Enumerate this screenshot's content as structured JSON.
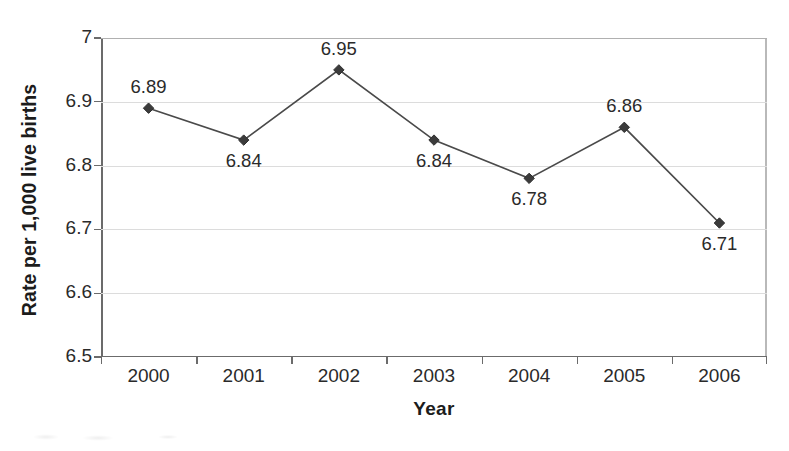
{
  "chart_data": {
    "type": "line",
    "title": "",
    "xlabel": "Year",
    "ylabel": "Rate per 1,000 live births",
    "categories": [
      "2000",
      "2001",
      "2002",
      "2003",
      "2004",
      "2005",
      "2006"
    ],
    "values": [
      6.89,
      6.84,
      6.95,
      6.84,
      6.78,
      6.86,
      6.71
    ],
    "point_labels": [
      "6.89",
      "6.84",
      "6.95",
      "6.84",
      "6.78",
      "6.86",
      "6.71"
    ],
    "label_positions": [
      "above",
      "below",
      "above",
      "below",
      "below",
      "above",
      "below"
    ],
    "ylim": [
      6.5,
      7.0
    ],
    "ytick_labels": [
      "7",
      "6.9",
      "6.8",
      "6.7",
      "6.6",
      "6.5"
    ],
    "ytick_values": [
      7.0,
      6.9,
      6.8,
      6.7,
      6.6,
      6.5
    ],
    "grid": true,
    "legend": "none",
    "marker": "diamond",
    "series_color": "#3b3b3b",
    "line_color": "#4a4a4a",
    "gridline_color": "#dcdcdc",
    "axis_color": "#6b6b6b"
  }
}
